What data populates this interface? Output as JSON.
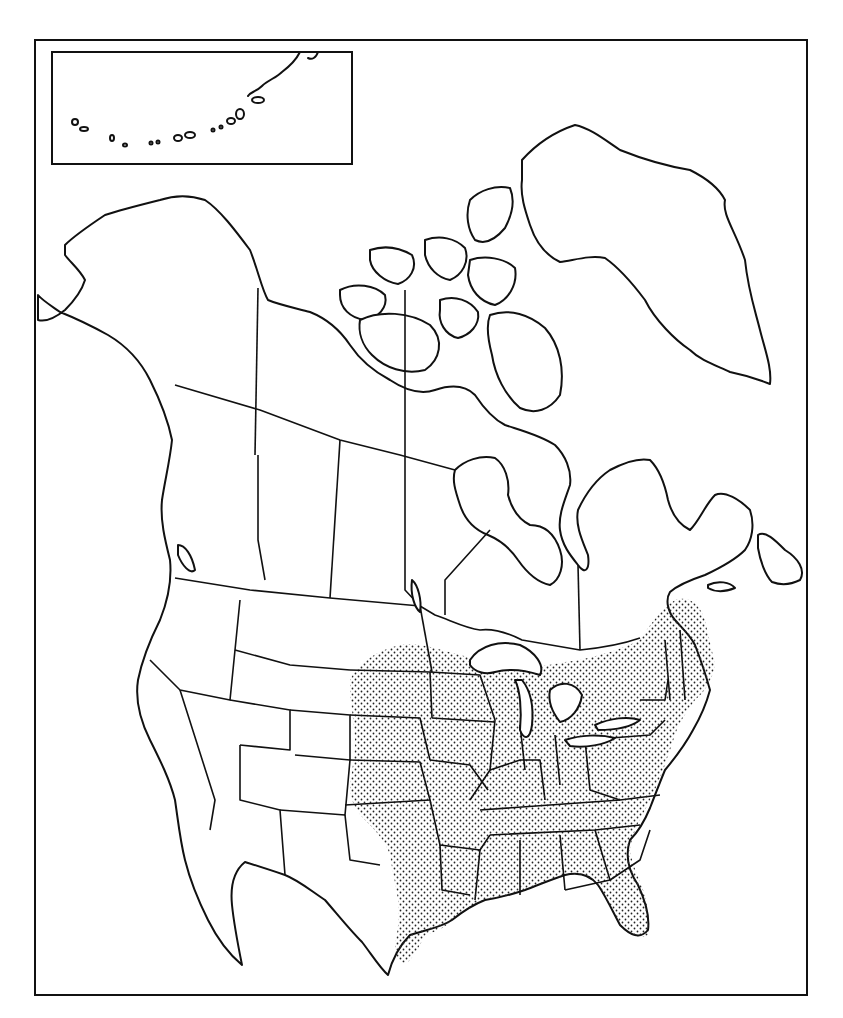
{
  "map": {
    "type": "range-map",
    "region": "North America",
    "frame": {
      "x": 35,
      "y": 40,
      "width": 772,
      "height": 955
    },
    "inset": {
      "x": 52,
      "y": 52,
      "width": 300,
      "height": 112,
      "content": "Aleutian Islands"
    },
    "range": {
      "fill_pattern": "stipple",
      "area": "Eastern United States and southeastern Canada"
    },
    "colors": {
      "line": "#111111",
      "background": "#ffffff",
      "stipple": "#222222"
    }
  }
}
